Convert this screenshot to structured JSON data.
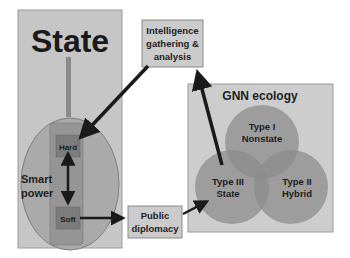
{
  "diagram": {
    "state_box": {
      "title": "State"
    },
    "smart_power": {
      "label_line1": "Smart",
      "label_line2": "power"
    },
    "hard": {
      "label": "Hard"
    },
    "soft": {
      "label": "Soft"
    },
    "intelligence": {
      "line1": "Intelligence",
      "line2": "gathering &",
      "line3": "analysis"
    },
    "public_diplomacy": {
      "line1": "Public",
      "line2": "diplomacy"
    },
    "gnn": {
      "title": "GNN ecology",
      "type1": {
        "line1": "Type I",
        "line2": "Nonstate"
      },
      "type2": {
        "line1": "Type II",
        "line2": "Hybrid"
      },
      "type3": {
        "line1": "Type III",
        "line2": "State"
      }
    }
  },
  "colors": {
    "box_fill": "#c8c8c8",
    "box_border": "#8a8a8a",
    "ellipse_fill": "#a9a9a9",
    "column_fill": "#8f8f8f",
    "inner_box_fill": "#7a7a7a",
    "circle_fill": "#9a9a9a",
    "arrow": "#1a1a1a"
  }
}
